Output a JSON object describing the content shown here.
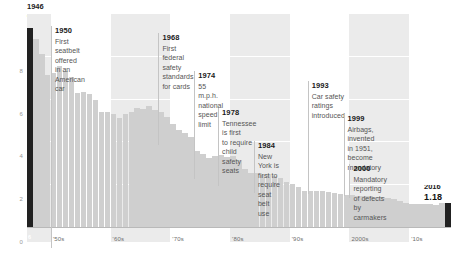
{
  "chart_data": {
    "type": "bar",
    "title": "",
    "xlabel": "",
    "ylabel": "",
    "ylim": [
      0,
      10
    ],
    "grid": true,
    "legend_position": "none",
    "x_tick_labels": [
      "'50s",
      "'60s",
      "'70s",
      "'80s",
      "'90s",
      "2000s",
      "'10s"
    ],
    "y_tick_labels": [
      "0",
      "2",
      "4",
      "6",
      "8"
    ],
    "y_ticks": [
      0,
      2,
      4,
      6,
      8
    ],
    "highlight_color": "#212121",
    "bar_color": "#cfcfcf",
    "band_color": "#ebebeb",
    "x": [
      1946,
      1947,
      1948,
      1949,
      1950,
      1951,
      1952,
      1953,
      1954,
      1955,
      1956,
      1957,
      1958,
      1959,
      1960,
      1961,
      1962,
      1963,
      1964,
      1965,
      1966,
      1967,
      1968,
      1969,
      1970,
      1971,
      1972,
      1973,
      1974,
      1975,
      1976,
      1977,
      1978,
      1979,
      1980,
      1981,
      1982,
      1983,
      1984,
      1985,
      1986,
      1987,
      1988,
      1989,
      1990,
      1991,
      1992,
      1993,
      1994,
      1995,
      1996,
      1997,
      1998,
      1999,
      2000,
      2001,
      2002,
      2003,
      2004,
      2005,
      2006,
      2007,
      2008,
      2009,
      2010,
      2011,
      2012,
      2013,
      2014,
      2015,
      2016
    ],
    "values": [
      9.35,
      8.82,
      8.11,
      7.13,
      7.24,
      7.56,
      7.36,
      7.08,
      6.33,
      6.34,
      6.28,
      5.98,
      5.41,
      5.41,
      5.31,
      5.16,
      5.32,
      5.41,
      5.63,
      5.54,
      5.72,
      5.5,
      5.4,
      5.21,
      4.88,
      4.57,
      4.43,
      4.24,
      3.59,
      3.45,
      3.25,
      3.35,
      3.39,
      3.34,
      3.35,
      3.17,
      2.76,
      2.58,
      2.57,
      2.47,
      2.51,
      2.41,
      2.32,
      2.17,
      2.08,
      1.91,
      1.75,
      1.75,
      1.73,
      1.73,
      1.69,
      1.64,
      1.58,
      1.55,
      1.53,
      1.51,
      1.51,
      1.48,
      1.44,
      1.46,
      1.42,
      1.36,
      1.26,
      1.15,
      1.11,
      1.1,
      1.14,
      1.1,
      1.08,
      1.15,
      1.18
    ],
    "annotations": [
      {
        "year": "1950",
        "text": "First seatbelt offered in an American car"
      },
      {
        "year": "1968",
        "text": "First federal safety standards for cards"
      },
      {
        "year": "1974",
        "text": "55 m.p.h. national speed limit"
      },
      {
        "year": "1978",
        "text": "Tennessee is first to require child safety seats"
      },
      {
        "year": "1984",
        "text": "New York is first to require seat belt use"
      },
      {
        "year": "1993",
        "text": "Car safety ratings introduced"
      },
      {
        "year": "1999",
        "text": "Airbags, invented in 1951, become mandatory"
      },
      {
        "year": "2000",
        "text": "Mandatory reporting of defects by carmakers"
      }
    ]
  },
  "annotations": [
    {
      "year": "1950",
      "line1": "First seatbelt offered",
      "line2": "in an American car",
      "line3": ""
    },
    {
      "year": "1968",
      "line1": "First federal safety",
      "line2": "standards for cards",
      "line3": ""
    },
    {
      "year": "1974",
      "line1": "55 m.p.h. national",
      "line2": "speed limit",
      "line3": ""
    },
    {
      "year": "1978",
      "line1": "Tennessee is first",
      "line2": "to require child safety",
      "line3": "seats"
    },
    {
      "year": "1984",
      "line1": "New York is first to",
      "line2": "require seat belt use",
      "line3": ""
    },
    {
      "year": "1993",
      "line1": "Car safety ratings",
      "line2": "introduced",
      "line3": ""
    },
    {
      "year": "1999",
      "line1": "Airbags, invented",
      "line2": "in 1951, become",
      "line3": "mandatory"
    },
    {
      "year": "2000",
      "line1": "Mandatory reporting",
      "line2": "of defects by",
      "line3": "carmakers"
    }
  ],
  "endpoints": {
    "start": {
      "year": "1946",
      "value": "9.35",
      "bar_label": "6"
    },
    "end": {
      "year": "2016",
      "value": "1.18",
      "bar_label": "6"
    }
  },
  "axis": {
    "y_labels": [
      "8",
      "6",
      "4",
      "2",
      "0"
    ],
    "x_labels": [
      "'50s",
      "'60s",
      "'70s",
      "'80s",
      "'90s",
      "2000s",
      "'10s"
    ]
  }
}
